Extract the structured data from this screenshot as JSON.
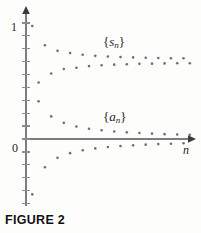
{
  "figure": {
    "caption": "FIGURE 2",
    "axis": {
      "y_top_label": "1",
      "origin_label": "0",
      "x_axis_label": "n",
      "y_tick_count": 14,
      "x_axis_has_ticks": false,
      "arrow_color": "#3a3a3f",
      "axis_color": "#7b7b80"
    },
    "series_labels": {
      "partial_sums": {
        "open_brace": "{",
        "symbol": "s",
        "subscript": "n",
        "close_brace": "}"
      },
      "terms": {
        "open_brace": "{",
        "symbol": "a",
        "subscript": "n",
        "close_brace": "}"
      }
    }
  },
  "chart_data": {
    "type": "scatter",
    "title": "FIGURE 2",
    "xlabel": "n",
    "ylabel": "",
    "grid": false,
    "legend_position": "inline-annotation",
    "dot_color": "#6f6f76",
    "dot_radius_px": 1.3,
    "axis_origin_px": {
      "x": 26,
      "y": 139
    },
    "x_step_px": 6.3,
    "y_unit_px": 113,
    "xlim": [
      0,
      27
    ],
    "ylim": [
      -0.49,
      1.06
    ],
    "annotations": [
      {
        "text": "{s_n}",
        "x_px": 103,
        "y_px": 35
      },
      {
        "text": "{a_n}",
        "x_px": 103,
        "y_px": 110
      }
    ],
    "series": [
      {
        "name": "{s_n}",
        "description": "partial sums of an alternating series, oscillating and converging to about 0.68",
        "x": [
          1,
          2,
          3,
          4,
          5,
          6,
          7,
          8,
          9,
          10,
          11,
          12,
          13,
          14,
          15,
          16,
          17,
          18,
          19,
          20,
          21,
          22,
          23,
          24,
          25,
          26
        ],
        "values": [
          1.0,
          0.5,
          0.83,
          0.58,
          0.78,
          0.62,
          0.76,
          0.63,
          0.745,
          0.645,
          0.736,
          0.653,
          0.73,
          0.658,
          0.725,
          0.662,
          0.722,
          0.665,
          0.719,
          0.667,
          0.717,
          0.669,
          0.715,
          0.67,
          0.714,
          0.671
        ]
      },
      {
        "name": "{a_n}",
        "description": "alternating terms decreasing in magnitude to 0",
        "x": [
          1,
          2,
          3,
          4,
          5,
          6,
          7,
          8,
          9,
          10,
          11,
          12,
          13,
          14,
          15,
          16,
          17,
          18,
          19,
          20,
          21,
          22,
          23,
          24,
          25,
          26
        ],
        "values": [
          -0.49,
          0.333,
          -0.25,
          0.2,
          -0.167,
          0.143,
          -0.125,
          0.111,
          -0.1,
          0.091,
          -0.083,
          0.077,
          -0.071,
          0.067,
          -0.063,
          0.059,
          -0.056,
          0.053,
          -0.05,
          0.048,
          -0.045,
          0.043,
          -0.042,
          0.04,
          -0.038,
          0.037
        ]
      }
    ]
  }
}
